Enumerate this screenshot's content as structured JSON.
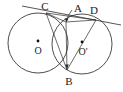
{
  "figure": {
    "type": "geometry-diagram",
    "width": 123,
    "height": 92,
    "background_color": "#ffffff",
    "stroke_color": "#2b2b2b",
    "label_color": "#1a1a1a"
  },
  "circles": [
    {
      "name": "left-circle",
      "center_label": "O",
      "cx": 38,
      "cy": 43,
      "r": 30,
      "center_dot_x": 38,
      "center_dot_y": 41,
      "label_x": 38,
      "label_y": 51
    },
    {
      "name": "right-circle",
      "center_label": "O'",
      "cx": 82,
      "cy": 44,
      "r": 30,
      "center_dot_x": 82,
      "center_dot_y": 42,
      "label_x": 82,
      "label_y": 52
    }
  ],
  "points": [
    {
      "name": "C",
      "label": "C",
      "x": 46,
      "y": 13,
      "label_x": 45,
      "label_y": 5
    },
    {
      "name": "A",
      "label": "A",
      "x": 66,
      "y": 22,
      "label_x": 77,
      "label_y": 7
    },
    {
      "name": "D",
      "label": "D",
      "x": 96,
      "y": 20,
      "label_x": 93,
      "label_y": 8
    },
    {
      "name": "B",
      "label": "B",
      "x": 67,
      "y": 70,
      "label_x": 68,
      "label_y": 81
    }
  ],
  "segments": [
    {
      "name": "tangent-line-CD",
      "x1": 22,
      "y1": 6,
      "x2": 120,
      "y2": 24
    },
    {
      "name": "chord-C-to-B",
      "x1": 46,
      "y1": 13,
      "x2": 67,
      "y2": 70
    },
    {
      "name": "chord-C-to-A",
      "x1": 46,
      "y1": 13,
      "x2": 66,
      "y2": 22
    },
    {
      "name": "chord-A-to-D",
      "x1": 66,
      "y1": 22,
      "x2": 96,
      "y2": 20
    },
    {
      "name": "chord-D-to-B",
      "x1": 96,
      "y1": 20,
      "x2": 67,
      "y2": 70
    },
    {
      "name": "chord-A-to-B",
      "x1": 66,
      "y1": 22,
      "x2": 67,
      "y2": 70
    },
    {
      "name": "chord-C-to-D-inner",
      "x1": 46,
      "y1": 13,
      "x2": 96,
      "y2": 20
    }
  ],
  "arrow_marker": {
    "name": "arrow-A-down",
    "x": 67,
    "y_from": 8,
    "y_to": 21
  }
}
